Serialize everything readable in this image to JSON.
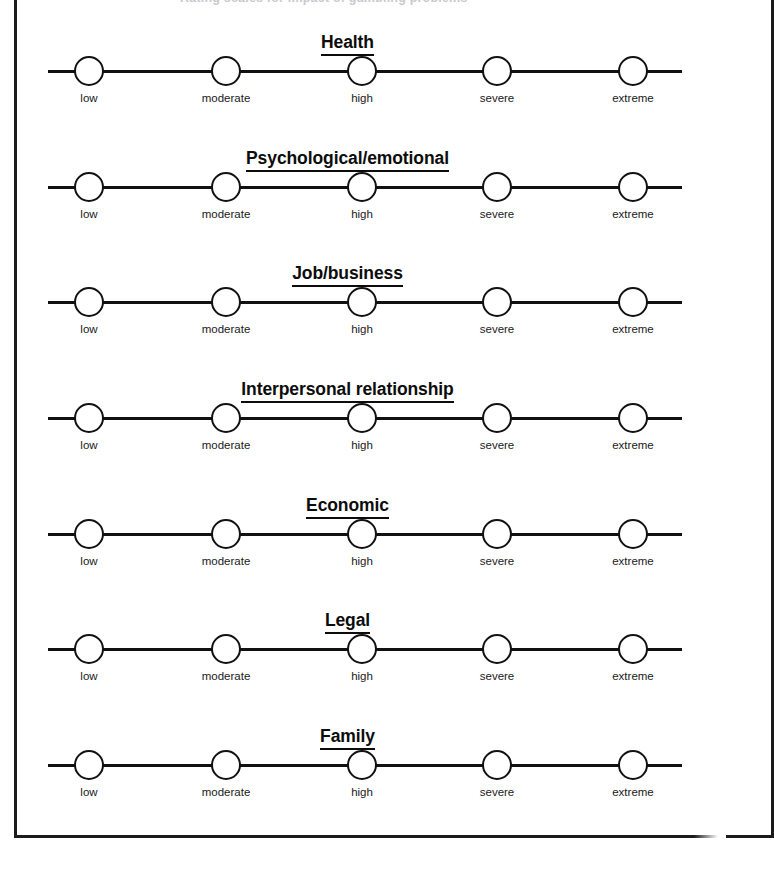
{
  "document": {
    "top_partial_text": "Rating scales for impact of gambling problems",
    "frame_color": "#1b1b1b",
    "ink_color": "#111111"
  },
  "scale": {
    "points": [
      {
        "label": "low",
        "x": 89
      },
      {
        "label": "moderate",
        "x": 226
      },
      {
        "label": "high",
        "x": 362
      },
      {
        "label": "severe",
        "x": 497
      },
      {
        "label": "extreme",
        "x": 633
      }
    ],
    "axis_start_x": 48,
    "axis_end_x": 682,
    "selected": null
  },
  "sections": [
    {
      "title": "Health",
      "top": 32
    },
    {
      "title": "Psychological/emotional",
      "top": 148
    },
    {
      "title": "Job/business",
      "top": 263
    },
    {
      "title": "Interpersonal relationship",
      "top": 379
    },
    {
      "title": "Economic",
      "top": 495
    },
    {
      "title": "Legal",
      "top": 610
    },
    {
      "title": "Family",
      "top": 726
    }
  ]
}
